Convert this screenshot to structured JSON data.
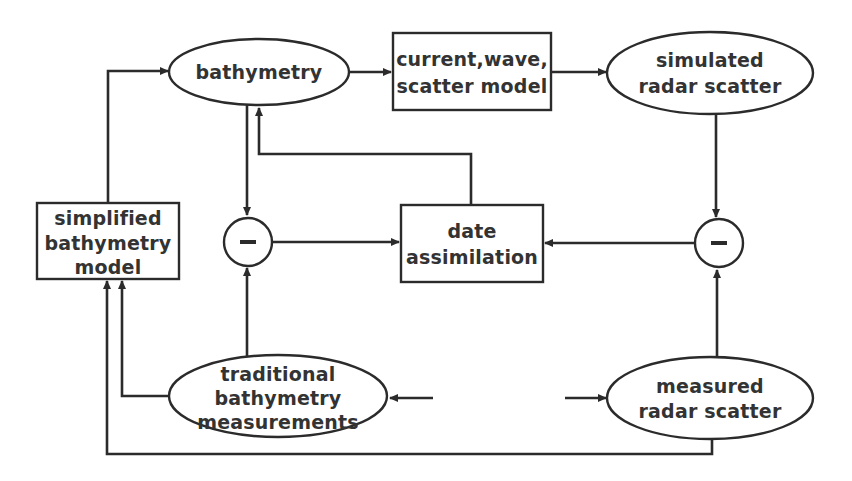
{
  "diagram": {
    "type": "flowchart",
    "nodes": {
      "bathymetry": {
        "shape": "ellipse",
        "lines": [
          "bathymetry"
        ]
      },
      "model_box": {
        "shape": "rect",
        "lines": [
          "current,wave,",
          "scatter model"
        ]
      },
      "simulated": {
        "shape": "ellipse",
        "lines": [
          "simulated",
          "radar scatter"
        ]
      },
      "simplified": {
        "shape": "rect",
        "lines": [
          "simplified",
          "bathymetry",
          "model"
        ]
      },
      "minus_left": {
        "shape": "circle",
        "symbol": "minus"
      },
      "assimilation": {
        "shape": "rect",
        "lines": [
          "date",
          "assimilation"
        ]
      },
      "minus_right": {
        "shape": "circle",
        "symbol": "minus"
      },
      "traditional": {
        "shape": "ellipse",
        "lines": [
          "traditional",
          "bathymetry",
          "measurements"
        ]
      },
      "measured": {
        "shape": "ellipse",
        "lines": [
          "measured",
          "radar scatter"
        ]
      }
    },
    "edges": [
      {
        "from": "simplified",
        "to": "bathymetry"
      },
      {
        "from": "bathymetry",
        "to": "model_box"
      },
      {
        "from": "model_box",
        "to": "simulated"
      },
      {
        "from": "bathymetry",
        "to": "minus_left"
      },
      {
        "from": "assimilation",
        "to": "bathymetry"
      },
      {
        "from": "simulated",
        "to": "minus_right"
      },
      {
        "from": "minus_left",
        "to": "assimilation"
      },
      {
        "from": "minus_right",
        "to": "assimilation"
      },
      {
        "from": "traditional",
        "to": "minus_left"
      },
      {
        "from": "measured",
        "to": "minus_right"
      },
      {
        "from": "traditional",
        "to": "simplified"
      },
      {
        "from": "measured",
        "to": "simplified"
      },
      {
        "from": "measured",
        "to": "traditional",
        "style": "broken-gap"
      }
    ],
    "colors": {
      "line": "#2b2b2b",
      "text": "#333333",
      "background": "#ffffff"
    }
  }
}
